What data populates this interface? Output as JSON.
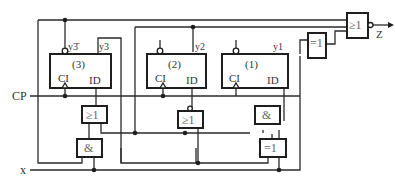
{
  "diagram": {
    "type": "sequential logic circuit",
    "flip_flops": [
      {
        "id": "ff3",
        "label": "(3)",
        "clock_label": "CI",
        "input_label": "ID",
        "output_label": "y3",
        "inverted_output_label": "y3̄"
      },
      {
        "id": "ff2",
        "label": "(2)",
        "clock_label": "CI",
        "input_label": "ID",
        "output_label": "y2"
      },
      {
        "id": "ff1",
        "label": "(1)",
        "clock_label": "CI",
        "input_label": "ID",
        "output_label": "y1"
      }
    ],
    "gates": {
      "nor_out": "≥1",
      "xor_top": "=1",
      "or_left": "≥1",
      "and_left": "&",
      "or_mid": "≥1",
      "and_right": "&",
      "xor_bottom": "=1"
    },
    "signals": {
      "clock": "CP",
      "input": "x",
      "output": "Z"
    }
  }
}
